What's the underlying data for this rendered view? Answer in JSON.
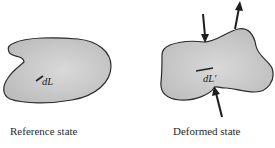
{
  "figure": {
    "reference": {
      "caption": "Reference state",
      "element_label": "dL"
    },
    "deformed": {
      "caption": "Deformed state",
      "element_label": "dL'"
    }
  },
  "colors": {
    "body_fill": "#c9c9c9",
    "body_fill_center": "#d8d8d8",
    "outline": "#2b2b2b",
    "text": "#2a2a2a"
  }
}
